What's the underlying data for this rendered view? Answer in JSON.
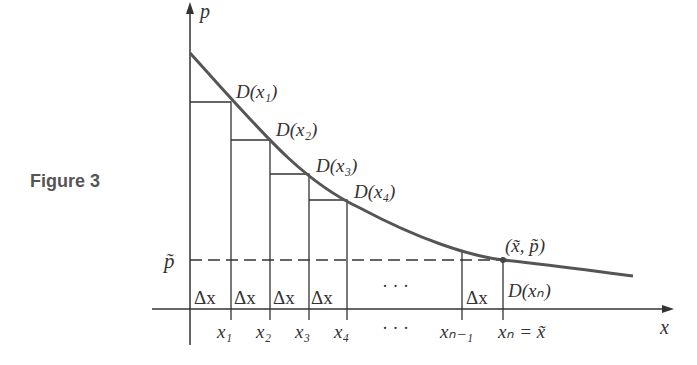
{
  "figure_label": "Figure 3",
  "axes": {
    "x_label": "x",
    "y_label": "p",
    "p_tilde_label": "p̃"
  },
  "curve": {
    "name": "D(x)",
    "color": "#555555"
  },
  "points": [
    {
      "label": "D(x₁)"
    },
    {
      "label": "D(x₂)"
    },
    {
      "label": "D(x₃)"
    },
    {
      "label": "D(x₄)"
    },
    {
      "label": "D(xₙ)"
    }
  ],
  "equilibrium_label": "(x̃, p̃)",
  "delta_label": "Δx",
  "ellipsis": "· · ·",
  "x_ticks": [
    "x₁",
    "x₂",
    "x₃",
    "x₄",
    "· · ·",
    "xₙ₋₁",
    "xₙ = x̃"
  ]
}
